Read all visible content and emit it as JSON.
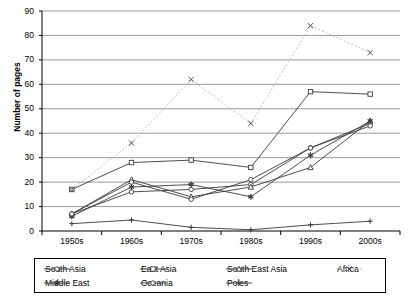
{
  "chart_data": {
    "type": "line",
    "title": "",
    "xlabel": "",
    "ylabel": "Number of pages",
    "categories": [
      "1950s",
      "1960s",
      "1970s",
      "1980s",
      "1990s",
      "2000s"
    ],
    "ylim": [
      0,
      90
    ],
    "ytick_values": [
      0,
      10,
      20,
      30,
      40,
      50,
      60,
      70,
      80,
      90
    ],
    "grid": true,
    "legend_position": "bottom",
    "series": [
      {
        "name": "South Asia",
        "marker": "circle",
        "dash": false,
        "values": [
          7,
          16,
          17,
          19,
          34,
          44
        ]
      },
      {
        "name": "East Asia",
        "marker": "square",
        "dash": false,
        "values": [
          17,
          28,
          29,
          26,
          57,
          56
        ]
      },
      {
        "name": "South East Asia",
        "marker": "triangle",
        "dash": false,
        "values": [
          7,
          21,
          14,
          18,
          26,
          45
        ]
      },
      {
        "name": "Africa",
        "marker": "cross",
        "dash": true,
        "values": [
          17,
          36,
          62,
          44,
          84,
          73
        ]
      },
      {
        "name": "Middle East",
        "marker": "star",
        "dash": false,
        "values": [
          6,
          18,
          19,
          14,
          31,
          45
        ]
      },
      {
        "name": "Oceania",
        "marker": "circle",
        "dash": false,
        "values": [
          7,
          20,
          13,
          21,
          34,
          43
        ]
      },
      {
        "name": "Poles",
        "marker": "plus",
        "dash": false,
        "values": [
          3,
          4.5,
          1.5,
          0.5,
          2.5,
          4
        ]
      }
    ]
  },
  "legend": {
    "items": [
      {
        "label": "South Asia"
      },
      {
        "label": "East Asia"
      },
      {
        "label": "South East Asia"
      },
      {
        "label": "Africa"
      },
      {
        "label": "Middle East"
      },
      {
        "label": "Oceania"
      },
      {
        "label": "Poles"
      }
    ]
  },
  "colors": {
    "axis": "#000000",
    "grid": "#808080",
    "line": "#3a3a3a",
    "light_line": "#b5b5b5",
    "background": "#ffffff"
  }
}
